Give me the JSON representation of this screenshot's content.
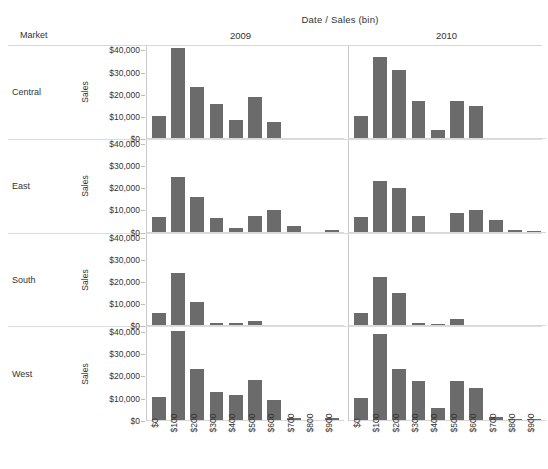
{
  "header": {
    "column_title": "Date  /  Sales (bin)",
    "market_label": "Market",
    "years": [
      "2009",
      "2010"
    ]
  },
  "axis": {
    "y_title": "Sales",
    "y_ticks": [
      "$40,000",
      "$30,000",
      "$20,000",
      "$10,000",
      "$0"
    ],
    "x_ticks": [
      "$0",
      "$100",
      "$200",
      "$300",
      "$400",
      "$500",
      "$600",
      "$700",
      "$800",
      "$900"
    ]
  },
  "colors": {
    "bar": "#6b6b6b",
    "grid": "#d8d8d8",
    "text": "#333333"
  },
  "chart_data": {
    "type": "bar",
    "title": "Date  /  Sales (bin)",
    "xlabel": "Sales (bin)",
    "ylabel": "Sales",
    "ylim": [
      0,
      42000
    ],
    "grid": false,
    "legend": "none",
    "layout": "trellis 4 rows (Market) x 2 columns (Date year)",
    "categories": [
      "$0",
      "$100",
      "$200",
      "$300",
      "$400",
      "$500",
      "$600",
      "$700",
      "$800",
      "$900"
    ],
    "row_field": "Market",
    "column_field": "Date",
    "rows": [
      "Central",
      "East",
      "South",
      "West"
    ],
    "columns": [
      "2009",
      "2010"
    ],
    "panels": [
      {
        "row": "Central",
        "column": "2009",
        "values": [
          10500,
          41000,
          23500,
          15800,
          8500,
          18800,
          7800,
          0,
          0,
          0
        ]
      },
      {
        "row": "Central",
        "column": "2010",
        "values": [
          10500,
          37000,
          31000,
          17000,
          3800,
          17000,
          15000,
          500,
          0,
          0
        ]
      },
      {
        "row": "East",
        "column": "2009",
        "values": [
          7200,
          25200,
          16000,
          6500,
          2200,
          7400,
          10200,
          3000,
          400,
          1200
        ]
      },
      {
        "row": "East",
        "column": "2010",
        "values": [
          7000,
          23400,
          20100,
          7500,
          300,
          8800,
          10200,
          5700,
          1300,
          900
        ]
      },
      {
        "row": "South",
        "column": "2009",
        "values": [
          6000,
          24200,
          11000,
          1500,
          1500,
          2300,
          500,
          0,
          0,
          0
        ]
      },
      {
        "row": "South",
        "column": "2010",
        "values": [
          6200,
          22200,
          15200,
          1300,
          900,
          3200,
          300,
          0,
          0,
          0
        ]
      },
      {
        "row": "West",
        "column": "2009",
        "values": [
          10700,
          40500,
          23200,
          13000,
          11600,
          18200,
          9500,
          1500,
          300,
          1500
        ]
      },
      {
        "row": "West",
        "column": "2010",
        "values": [
          10300,
          39200,
          23200,
          17800,
          6000,
          18000,
          15000,
          2000,
          800,
          700
        ]
      }
    ]
  }
}
